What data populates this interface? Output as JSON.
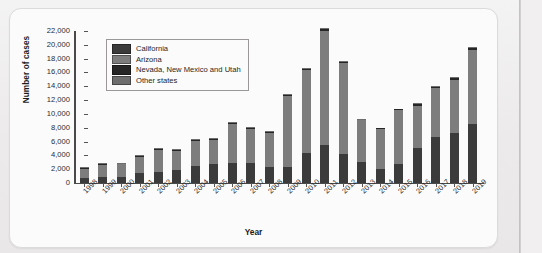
{
  "figure": {
    "ylabel": "Number of cases",
    "xlabel": "Year"
  },
  "legend": {
    "items": [
      {
        "label": "California",
        "color": "#3b3b3b"
      },
      {
        "label": "Arizona",
        "color": "#7d7d7d"
      },
      {
        "label": "Nevada, New Mexico and Utah",
        "color": "#262626"
      },
      {
        "label": "Other states",
        "color": "#6e6e6e"
      }
    ]
  },
  "yticks": [
    "0",
    "2,000",
    "4,000",
    "6,000",
    "8,000",
    "10,000",
    "12,000",
    "14,000",
    "16,000",
    "18,000",
    "20,000",
    "22,000"
  ],
  "chart_data": {
    "type": "bar",
    "title": "",
    "subtitle": "",
    "xlabel": "Year",
    "ylabel": "Number of cases",
    "ylim": [
      0,
      22000
    ],
    "ytick_step": 2000,
    "grid": false,
    "stacked": true,
    "legend_position": "top-left",
    "categories": [
      "1998",
      "1999",
      "2000",
      "2001",
      "2002",
      "2003",
      "2004",
      "2005",
      "2006",
      "2007",
      "2008",
      "2009",
      "2010",
      "2011",
      "2012",
      "2013",
      "2014",
      "2015",
      "2016",
      "2017",
      "2018",
      "2019"
    ],
    "series": [
      {
        "name": "California",
        "color": "#3b3b3b",
        "values": [
          700,
          850,
          800,
          1400,
          1600,
          1950,
          2500,
          2700,
          2950,
          2900,
          2350,
          2300,
          4400,
          5550,
          4250,
          3050,
          2000,
          2750,
          5050,
          6650,
          7200,
          8600
        ]
      },
      {
        "name": "Arizona",
        "color": "#7d7d7d",
        "values": [
          1400,
          1800,
          1900,
          2400,
          3200,
          2750,
          3650,
          3600,
          5600,
          4900,
          4950,
          10300,
          11950,
          16450,
          13100,
          6000,
          5800,
          7750,
          6150,
          7050,
          7700,
          10700
        ]
      },
      {
        "name": "Nevada, New Mexico and Utah",
        "color": "#262626",
        "values": [
          100,
          100,
          100,
          100,
          100,
          100,
          120,
          120,
          160,
          150,
          150,
          180,
          220,
          280,
          230,
          120,
          120,
          180,
          230,
          250,
          260,
          280
        ]
      },
      {
        "name": "Other states",
        "color": "#6e6e6e",
        "values": [
          100,
          100,
          100,
          100,
          100,
          100,
          100,
          100,
          100,
          100,
          100,
          100,
          130,
          150,
          130,
          100,
          100,
          100,
          120,
          150,
          150,
          150
        ]
      }
    ],
    "totals": [
      2300,
      2850,
      2900,
      4000,
      5000,
      4900,
      6370,
      6520,
      8810,
      8050,
      7550,
      12880,
      16700,
      22430,
      17710,
      9270,
      8020,
      10780,
      11550,
      14100,
      15310,
      19730
    ]
  }
}
